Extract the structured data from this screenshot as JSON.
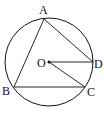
{
  "diagram": {
    "type": "circle-inscribed-triangle",
    "circle": {
      "center": "O",
      "cx": 49,
      "cy": 62,
      "r": 46
    },
    "points": [
      {
        "name": "A",
        "label": "A",
        "x": 44,
        "y": 19
      },
      {
        "name": "B",
        "label": "B",
        "x": 14,
        "y": 87
      },
      {
        "name": "C",
        "label": "C",
        "x": 85,
        "y": 87
      },
      {
        "name": "D",
        "label": "D",
        "x": 93,
        "y": 62
      },
      {
        "name": "O",
        "label": "O",
        "x": 49,
        "y": 62
      }
    ],
    "segments": [
      "AB",
      "BC",
      "AD",
      "OD",
      "OC"
    ],
    "colors": {
      "stroke": "#111111",
      "background": "#ffffff"
    }
  }
}
